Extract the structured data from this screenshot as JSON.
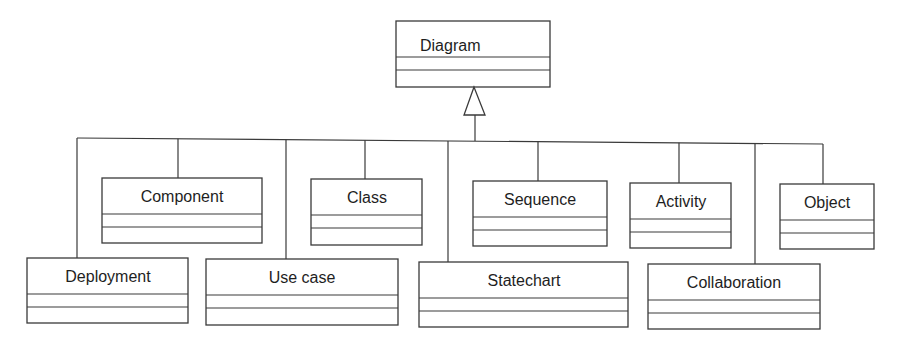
{
  "diagram": {
    "type": "UML class generalization hierarchy",
    "parent": {
      "name": "Diagram",
      "x": 396,
      "y": 21,
      "w": 154,
      "h": 66,
      "label_x": 420,
      "label_y": 45
    },
    "generalization_arrow": {
      "style": "hollow-triangle",
      "apex": [
        474,
        87
      ],
      "base_left": [
        464,
        115
      ],
      "base_right": [
        485,
        115
      ],
      "stem": [
        [
          475,
          115
        ],
        [
          475,
          141
        ]
      ]
    },
    "bus": {
      "x1": 77,
      "y1": 138,
      "x2": 823,
      "y2": 144
    },
    "children": [
      {
        "name": "Component",
        "x": 102,
        "y": 178,
        "w": 160,
        "h": 65,
        "conn_x": 178,
        "row": "upper"
      },
      {
        "name": "Class",
        "x": 311,
        "y": 179,
        "w": 111,
        "h": 66,
        "conn_x": 365,
        "row": "upper"
      },
      {
        "name": "Sequence",
        "x": 473,
        "y": 181,
        "w": 134,
        "h": 65,
        "conn_x": 538,
        "row": "upper"
      },
      {
        "name": "Activity",
        "x": 630,
        "y": 183,
        "w": 101,
        "h": 65,
        "conn_x": 679,
        "row": "upper"
      },
      {
        "name": "Object",
        "x": 780,
        "y": 184,
        "w": 94,
        "h": 65,
        "conn_x": 823,
        "row": "upper"
      },
      {
        "name": "Deployment",
        "x": 27,
        "y": 258,
        "w": 161,
        "h": 65,
        "conn_x": 77,
        "row": "lower"
      },
      {
        "name": "Use case",
        "x": 206,
        "y": 259,
        "w": 192,
        "h": 66,
        "conn_x": 286,
        "row": "lower"
      },
      {
        "name": "Statechart",
        "x": 419,
        "y": 262,
        "w": 209,
        "h": 65,
        "conn_x": 448,
        "row": "lower"
      },
      {
        "name": "Collaboration",
        "x": 648,
        "y": 264,
        "w": 172,
        "h": 65,
        "conn_x": 755,
        "row": "lower"
      }
    ]
  },
  "colors": {
    "line": "#3a3a3a",
    "text": "#1e1e1e",
    "background": "#ffffff"
  }
}
